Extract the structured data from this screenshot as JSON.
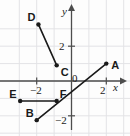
{
  "figure": {
    "type": "coordinate-plane-with-segments",
    "background": "#fdfdfd",
    "grid_color": "#e3e3e6",
    "axis_color": "#4d4d4d",
    "ink_color": "#1a1a1a"
  },
  "axes": {
    "x_label": "x",
    "y_label": "y",
    "origin_label": "0",
    "x_ticks": [
      {
        "label": "−2",
        "value": -2
      },
      {
        "label": "2",
        "value": 2
      }
    ],
    "y_ticks": [
      {
        "label": "2",
        "value": 2
      },
      {
        "label": "−2",
        "value": -2
      }
    ],
    "xlim": [
      -3.9,
      3.3
    ],
    "ylim": [
      -3.1,
      3.9
    ]
  },
  "chart_data": {
    "type": "scatter",
    "title": "",
    "xlabel": "x",
    "ylabel": "y",
    "xlim": [
      -3.9,
      3.3
    ],
    "ylim": [
      -3.1,
      3.9
    ],
    "grid": true,
    "legend": "none",
    "points": [
      {
        "name": "A",
        "x": 2,
        "y": 1,
        "label": "A",
        "label_pos": "right"
      },
      {
        "name": "B",
        "x": -2,
        "y": -2.25,
        "label": "B",
        "label_pos": "upper-left"
      },
      {
        "name": "C",
        "x": -0.85,
        "y": 0.9,
        "label": "C",
        "label_pos": "lower-right"
      },
      {
        "name": "D",
        "x": -1.9,
        "y": 3.25,
        "label": "D",
        "label_pos": "upper-left"
      },
      {
        "name": "E",
        "x": -2.95,
        "y": -1.15,
        "label": "E",
        "label_pos": "upper-left"
      },
      {
        "name": "F",
        "x": -0.85,
        "y": -1.15,
        "label": "F",
        "label_pos": "upper-right"
      }
    ],
    "segments": [
      {
        "name": "segment-DC",
        "from": "D",
        "to": "C"
      },
      {
        "name": "segment-EF",
        "from": "E",
        "to": "F"
      },
      {
        "name": "segment-BA",
        "from": "B",
        "to": "A"
      }
    ]
  }
}
